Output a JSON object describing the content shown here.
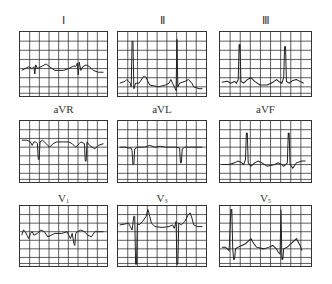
{
  "figure": {
    "grid_color": "#333333",
    "trace_color": "#222222",
    "background": "#ffffff"
  },
  "leads": [
    {
      "id": "I",
      "label": "Ⅰ",
      "sub": ""
    },
    {
      "id": "II",
      "label": "Ⅱ",
      "sub": ""
    },
    {
      "id": "III",
      "label": "Ⅲ",
      "sub": ""
    },
    {
      "id": "aVR",
      "label": "aVR",
      "sub": ""
    },
    {
      "id": "aVL",
      "label": "aVL",
      "sub": ""
    },
    {
      "id": "aVF",
      "label": "aVF",
      "sub": ""
    },
    {
      "id": "V1",
      "label": "V",
      "sub": "1"
    },
    {
      "id": "V3",
      "label": "V",
      "sub": "3"
    },
    {
      "id": "V5",
      "label": "V",
      "sub": "5"
    }
  ]
}
